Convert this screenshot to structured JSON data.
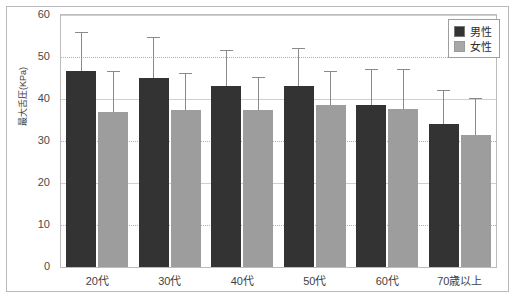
{
  "chart_data": {
    "type": "bar",
    "title": "",
    "xlabel": "",
    "ylabel": "最大舌圧(KPa)",
    "ylim": [
      0,
      60
    ],
    "ytick_step": 10,
    "yticks": [
      "0",
      "10",
      "20",
      "30",
      "40",
      "50",
      "60"
    ],
    "grid": true,
    "legend_position": "top-right",
    "categories": [
      "20代",
      "30代",
      "40代",
      "50代",
      "60代",
      "70歳以上"
    ],
    "series": [
      {
        "name": "男性",
        "color": "#333333",
        "values": [
          46.6,
          45.0,
          43.0,
          43.1,
          38.5,
          34.0
        ],
        "errors_upper": [
          55.6,
          54.5,
          51.5,
          51.8,
          47.0,
          42.0
        ]
      },
      {
        "name": "女性",
        "color": "#9d9d9d",
        "values": [
          37.0,
          37.5,
          37.5,
          38.5,
          37.6,
          31.5
        ],
        "errors_upper": [
          46.5,
          46.0,
          45.0,
          46.5,
          46.8,
          40.0
        ]
      }
    ]
  },
  "legend": {
    "male_label": "男性",
    "female_label": "女性"
  },
  "axis": {
    "y_title": "最大舌圧(KPa)",
    "y_labels": [
      "60",
      "50",
      "40",
      "30",
      "20",
      "10",
      "0"
    ],
    "x_labels": [
      "20代",
      "30代",
      "40代",
      "50代",
      "60代",
      "70歳以上"
    ]
  },
  "colors": {
    "male": "#333333",
    "female": "#9d9d9d",
    "grid": "#b0b0b0",
    "frame": "#b9b9b9",
    "error": "#8a8a8a"
  }
}
